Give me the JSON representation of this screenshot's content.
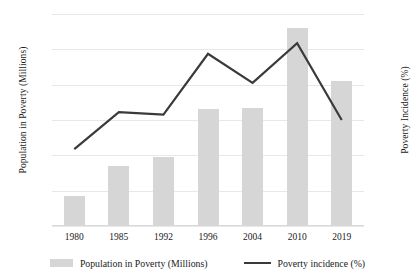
{
  "chart_data": {
    "type": "bar",
    "title": "",
    "subtitle": "",
    "xlabel": "",
    "ylabel": "Population in Poverty (Millions)",
    "y2label": "Poverty Incidence (%)",
    "categories": [
      "1980",
      "1985",
      "1992",
      "1996",
      "2004",
      "2010",
      "2019"
    ],
    "series": [
      {
        "name": "Population in Poverty (Millions)",
        "type": "bar",
        "axis": "left",
        "color": "#d6d6d6",
        "values": [
          17,
          34,
          39,
          66,
          67,
          112,
          82
        ]
      },
      {
        "name": "Poverty incidence (%)",
        "type": "line",
        "axis": "right",
        "color": "#3a3a3a",
        "values": [
          29,
          43,
          42,
          65,
          54,
          69,
          40
        ]
      }
    ],
    "ylim": [
      0,
      120
    ],
    "yticks": [
      0,
      20,
      40,
      60,
      80,
      100,
      120
    ],
    "y2lim": [
      0,
      80
    ],
    "y2ticks": [
      0,
      10,
      20,
      30,
      40,
      50,
      60,
      70,
      80
    ],
    "grid": true,
    "legend_position": "bottom"
  },
  "legend": {
    "bar_label": "Population in Poverty (Millions)",
    "line_label": "Poverty incidence (%)"
  },
  "axes": {
    "left_title": "Population in Poverty (Millions)",
    "right_title": "Poverty Incidence (%)"
  }
}
